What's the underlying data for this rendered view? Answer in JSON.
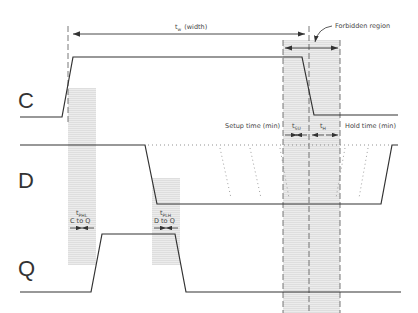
{
  "diagram": {
    "type": "timing-diagram",
    "signals": [
      {
        "name": "C",
        "label": "C"
      },
      {
        "name": "D",
        "label": "D"
      },
      {
        "name": "Q",
        "label": "Q"
      }
    ],
    "annotations": {
      "width": {
        "main": "t",
        "sub": "w",
        "rest": "(width)"
      },
      "forbidden": "Forbidden region",
      "setup_time": "Setup time (min)",
      "hold_time": "Hold time (min)",
      "tsu": {
        "main": "t",
        "sub": "SU"
      },
      "th": {
        "main": "t",
        "sub": "H"
      },
      "tphl": {
        "main": "t",
        "sub": "PHL",
        "line2": "C  to  Q"
      },
      "tplh": {
        "main": "t",
        "sub": "PLH",
        "line2": "D  to  Q"
      }
    },
    "colors": {
      "line": "#333333",
      "shade": "#e6e6e6",
      "dash": "#555555"
    }
  }
}
